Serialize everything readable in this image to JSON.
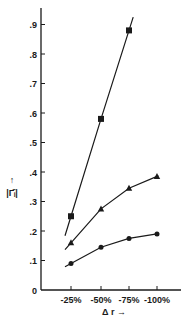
{
  "chart_data": {
    "type": "line",
    "title": "",
    "xlabel": "Δ r →",
    "ylabel": "|Γ̄ᵢ| ↑",
    "categories": [
      "-25%",
      "-50%",
      "-75%",
      "-100%"
    ],
    "ylim": [
      0,
      0.95
    ],
    "yticks": [
      "0",
      ".1",
      ".2",
      ".3",
      ".4",
      ".5",
      ".6",
      ".7",
      ".8",
      ".9"
    ],
    "ytick_values": [
      0,
      0.1,
      0.2,
      0.3,
      0.4,
      0.5,
      0.6,
      0.7,
      0.8,
      0.9
    ],
    "grid": false,
    "legend": "none",
    "series": [
      {
        "name": "square",
        "marker": "square",
        "values": [
          0.25,
          0.58,
          0.88,
          null
        ]
      },
      {
        "name": "triangle",
        "marker": "triangle",
        "values": [
          0.16,
          0.275,
          0.345,
          0.385
        ]
      },
      {
        "name": "circle",
        "marker": "circle",
        "values": [
          0.09,
          0.145,
          0.175,
          0.19
        ]
      }
    ]
  },
  "labels": {
    "x_axis": "Δ r →",
    "y_axis_arrow": "↑",
    "y_axis": "|Γ̄ᵢ|"
  },
  "colors": {
    "ink": "#1a1a1a",
    "background": "#ffffff"
  }
}
